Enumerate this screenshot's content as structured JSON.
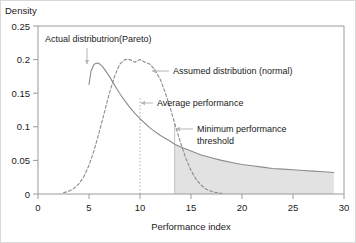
{
  "chart_data": {
    "type": "line",
    "title": "",
    "xlabel": "Performance index",
    "ylabel": "Density",
    "xlim": [
      0,
      30
    ],
    "ylim": [
      0,
      0.25
    ],
    "xticks": [
      0,
      5,
      10,
      15,
      20,
      25,
      30
    ],
    "yticks": [
      0,
      0.05,
      0.1,
      0.15,
      0.2,
      0.25
    ],
    "xtick_labels": [
      "0",
      "5",
      "10",
      "15",
      "20",
      "25",
      "30"
    ],
    "ytick_labels": [
      "0",
      "0.05",
      "0.1",
      "0.15",
      "0.2",
      "0.25"
    ],
    "grid": false,
    "legend_position": "none",
    "series": [
      {
        "name": "Actual distributrion(Pareto)",
        "style": "solid",
        "color": "#8c8c8c",
        "x": [
          5.0,
          5.2,
          5.5,
          5.8,
          6.0,
          6.3,
          6.6,
          7.0,
          7.5,
          8.0,
          8.5,
          9.0,
          9.5,
          10.0,
          11.0,
          12.0,
          13.0,
          13.4,
          14.0,
          15.0,
          16.0,
          17.0,
          18.0,
          19.0,
          20.0,
          21.0,
          22.0,
          23.0,
          24.0,
          25.0,
          26.0,
          27.0,
          28.0,
          29.0
        ],
        "y": [
          0.163,
          0.183,
          0.193,
          0.195,
          0.194,
          0.19,
          0.184,
          0.175,
          0.162,
          0.15,
          0.139,
          0.129,
          0.12,
          0.112,
          0.098,
          0.087,
          0.078,
          0.074,
          0.07,
          0.064,
          0.058,
          0.054,
          0.05,
          0.047,
          0.044,
          0.042,
          0.04,
          0.038,
          0.037,
          0.036,
          0.035,
          0.034,
          0.033,
          0.032
        ]
      },
      {
        "name": "Assumed distribution (normal)",
        "style": "dashed",
        "color": "#8c8c8c",
        "x": [
          2.5,
          3.0,
          3.5,
          4.0,
          4.5,
          5.0,
          5.5,
          6.0,
          6.5,
          7.0,
          7.5,
          8.0,
          8.5,
          9.0,
          9.5,
          10.0,
          10.5,
          11.0,
          11.5,
          12.0,
          12.5,
          13.0,
          13.5,
          14.0,
          14.5,
          15.0,
          15.5,
          16.0,
          16.5,
          17.0,
          17.5,
          18.0
        ],
        "y": [
          0.002,
          0.004,
          0.008,
          0.015,
          0.026,
          0.043,
          0.065,
          0.092,
          0.121,
          0.15,
          0.175,
          0.193,
          0.2,
          0.2,
          0.196,
          0.2,
          0.196,
          0.193,
          0.184,
          0.17,
          0.15,
          0.126,
          0.1,
          0.075,
          0.053,
          0.035,
          0.022,
          0.013,
          0.007,
          0.004,
          0.002,
          0.001
        ]
      }
    ],
    "vertical_lines": [
      {
        "name": "Average performance",
        "x": 10,
        "y_top": 0.145,
        "style": "dotted",
        "color": "#b0b0b0"
      },
      {
        "name": "Minimum performance threshold",
        "x": 13.4,
        "y_top": 0.105,
        "style": "solid",
        "color": "#c0c0c0"
      }
    ],
    "shaded_region": {
      "name": "tail-above-threshold",
      "x_start": 13.4,
      "x_end": 29.0,
      "fill": "#e2e2e2",
      "description": "Area under actual (Pareto) distribution beyond the minimum performance threshold"
    },
    "annotations": [
      {
        "id": "pareto",
        "text": "Actual distributrion(Pareto)",
        "x_text": 44,
        "y_text": 41,
        "arrow": "down",
        "target_x": 86,
        "target_y": 63
      },
      {
        "id": "normal",
        "text": "Assumed distribution (normal)",
        "x_text": 172,
        "y_text": 73,
        "arrow": "left",
        "target_x": 151,
        "target_y": 70
      },
      {
        "id": "average",
        "text": "Average performance",
        "x_text": 156,
        "y_text": 105,
        "arrow": "left",
        "target_x": 140,
        "target_y": 102
      },
      {
        "id": "threshold",
        "text": "Minimum performance",
        "text_line2": "threshold",
        "x_text": 196,
        "y_text": 131,
        "arrow": "left",
        "target_x": 175,
        "target_y": 128
      }
    ]
  }
}
